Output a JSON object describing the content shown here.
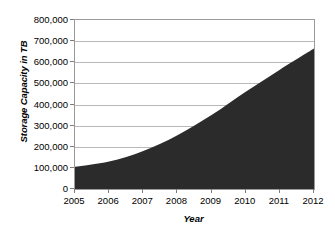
{
  "chart_data": {
    "type": "area",
    "title": "",
    "xlabel": "Year",
    "ylabel": "Storage Capacity in TB",
    "categories": [
      "2005",
      "2006",
      "2007",
      "2008",
      "2009",
      "2010",
      "2011",
      "2012"
    ],
    "x": [
      2005,
      2006,
      2007,
      2008,
      2009,
      2010,
      2011,
      2012
    ],
    "values": [
      105000,
      130000,
      180000,
      255000,
      350000,
      460000,
      565000,
      665000
    ],
    "series": [
      {
        "name": "Storage Capacity",
        "values": [
          105000,
          130000,
          180000,
          255000,
          350000,
          460000,
          565000,
          665000
        ]
      }
    ],
    "ylim": [
      0,
      800000
    ],
    "xlim": [
      2005,
      2012
    ],
    "ytick_values": [
      0,
      100000,
      200000,
      300000,
      400000,
      500000,
      600000,
      700000,
      800000
    ],
    "ytick_labels": [
      "0",
      "100,000",
      "200,000",
      "300,000",
      "400,000",
      "500,000",
      "600,000",
      "700,000",
      "800,000"
    ],
    "xtick_labels": [
      "2005",
      "2006",
      "2007",
      "2008",
      "2009",
      "2010",
      "2011",
      "2012"
    ],
    "grid": true,
    "grid_axis": "y",
    "legend": false,
    "legend_position": "none",
    "area_color": "#2b2b2b",
    "grid_color": "#b9b9b9",
    "frame_color": "#9a9a9a",
    "plot_background": "#ffffff",
    "text_color": "#000000"
  }
}
